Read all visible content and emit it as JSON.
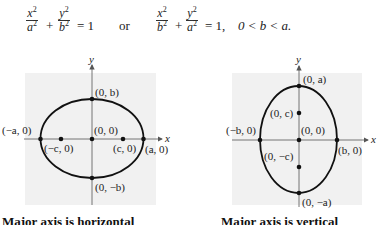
{
  "equations": {
    "first": {
      "x_num": "x",
      "x_den": "a",
      "y_num": "y",
      "y_den": "b",
      "exp": "2",
      "plus": "+",
      "equals": "= 1"
    },
    "connector": "or",
    "second": {
      "x_num": "x",
      "x_den": "b",
      "y_num": "y",
      "y_den": "a",
      "exp": "2",
      "plus": "+",
      "equals": "= 1,"
    },
    "condition": "0 < b < a."
  },
  "plots": [
    {
      "orientation": "horizontal",
      "axis_x_label": "x",
      "axis_y_label": "y",
      "points": {
        "top": "(0, b)",
        "center": "(0, 0)",
        "left_vertex": "(−a, 0)",
        "right_vertex": "(a, 0)",
        "left_focus": "(−c, 0)",
        "right_focus": "(c, 0)",
        "bottom": "(0, −b)"
      },
      "caption": "Major axis is horizontal"
    },
    {
      "orientation": "vertical",
      "axis_x_label": "x",
      "axis_y_label": "y",
      "points": {
        "top": "(0, a)",
        "upper_focus": "(0, c)",
        "center": "(0, 0)",
        "left": "(−b, 0)",
        "right": "(b, 0)",
        "lower_focus": "(0, −c)",
        "bottom": "(0, −a)"
      },
      "caption": "Major axis is vertical"
    }
  ],
  "colors": {
    "plot_background": "#f1f1f1",
    "ink": "#222222"
  }
}
